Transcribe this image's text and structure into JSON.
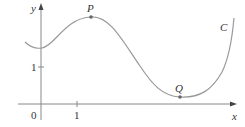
{
  "figure": {
    "type": "function-graph",
    "axes": {
      "x_label": "x",
      "y_label": "y",
      "origin_label": "0",
      "x_tick_label": "1",
      "y_tick_label": "1"
    },
    "curve": {
      "label": "C",
      "color": "#999999"
    },
    "points": [
      {
        "label": "P",
        "description": "local maximum"
      },
      {
        "label": "Q",
        "description": "local minimum"
      }
    ],
    "colors": {
      "axis": "#888888",
      "text": "#333333",
      "point": "#666666"
    }
  }
}
